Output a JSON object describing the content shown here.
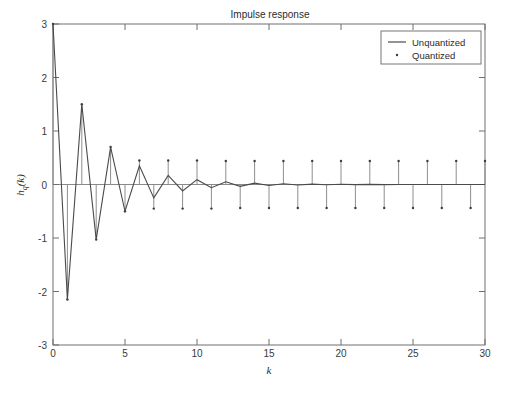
{
  "figure": {
    "title": "Impulse response",
    "background": "#ffffff",
    "line_color": "#4a4a4a",
    "stem_color": "#8e8e8e",
    "axis_color": "#6e6e6e"
  },
  "legend": {
    "position": "top-right",
    "entries": [
      {
        "label": "Unquantized",
        "marker": "line"
      },
      {
        "label": "Quantized",
        "marker": "dot"
      }
    ]
  },
  "axes": {
    "xlabel": "k",
    "ylabel_main": "h",
    "ylabel_sub": "q",
    "ylabel_tail": "(k)",
    "xticks": [
      "0",
      "5",
      "10",
      "15",
      "20",
      "25",
      "30"
    ],
    "yticks": [
      "3",
      "2",
      "1",
      "0",
      "-1",
      "-2",
      "-3"
    ]
  },
  "chart_data": {
    "type": "line",
    "title": "Impulse response",
    "xlabel": "k",
    "ylabel": "h_q(k)",
    "xlim": [
      0,
      30
    ],
    "ylim": [
      -3,
      3
    ],
    "xticks": [
      0,
      5,
      10,
      15,
      20,
      25,
      30
    ],
    "yticks": [
      -3,
      -2,
      -1,
      0,
      1,
      2,
      3
    ],
    "grid": false,
    "legend_position": "upper right",
    "x": [
      0,
      1,
      2,
      3,
      4,
      5,
      6,
      7,
      8,
      9,
      10,
      11,
      12,
      13,
      14,
      15,
      16,
      17,
      18,
      19,
      20,
      21,
      22,
      23,
      24,
      25,
      26,
      27,
      28,
      29,
      30
    ],
    "series": [
      {
        "name": "Unquantized",
        "style": "line",
        "values": [
          3.0,
          -2.15,
          1.5,
          -1.03,
          0.7,
          -0.5,
          0.35,
          -0.25,
          0.17,
          -0.12,
          0.09,
          -0.06,
          0.05,
          -0.035,
          0.025,
          -0.018,
          0.013,
          -0.009,
          0.007,
          -0.005,
          0.004,
          -0.003,
          0.002,
          -0.0015,
          0.001,
          -0.0008,
          0.0006,
          -0.0004,
          0.0003,
          -0.0002,
          0.0002
        ]
      },
      {
        "name": "Quantized",
        "style": "stem",
        "values": [
          3.0,
          -2.15,
          1.5,
          -1.03,
          0.7,
          -0.5,
          0.45,
          -0.45,
          0.45,
          -0.45,
          0.45,
          -0.45,
          0.44,
          -0.44,
          0.44,
          -0.44,
          0.44,
          -0.44,
          0.44,
          -0.44,
          0.44,
          -0.44,
          0.44,
          -0.44,
          0.44,
          -0.44,
          0.44,
          -0.44,
          0.44,
          -0.44,
          0.44
        ]
      }
    ]
  }
}
